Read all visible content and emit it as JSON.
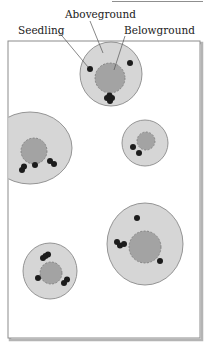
{
  "figure": {
    "width": 207,
    "height": 345,
    "colors": {
      "background": "#ffffff",
      "frame_border": "#8c8c8c",
      "frame_shadow": "#b4b4b4",
      "aboveground_fill": "#d6d6d6",
      "aboveground_stroke": "#8a8a8a",
      "belowground_fill": "#a3a3a3",
      "belowground_stroke": "#7a7a7a",
      "seedling": "#1c1c1c",
      "leader_line": "#555555",
      "top_rule": "#8f8f8f"
    },
    "top_rule": {
      "x1": 112,
      "x2": 203,
      "y": 1.5
    },
    "frame": {
      "x": 8,
      "y": 41,
      "width": 192,
      "height": 297
    },
    "labels": {
      "aboveground": {
        "text": "Aboveground",
        "x": 65,
        "y": 18
      },
      "seedling": {
        "text": "Seedling",
        "x": 18,
        "y": 34
      },
      "belowground": {
        "text": "Belowground",
        "x": 124,
        "y": 34
      }
    },
    "leaders": [
      {
        "name": "seedling-leader",
        "x1": 58,
        "y1": 31,
        "x2": 88,
        "y2": 67
      },
      {
        "name": "aboveground-leader",
        "x1": 90,
        "y1": 21,
        "x2": 103,
        "y2": 53
      },
      {
        "name": "belowground-leader",
        "x1": 125,
        "y1": 36,
        "x2": 114,
        "y2": 70
      }
    ],
    "patches": [
      {
        "name": "patch-top",
        "outer": {
          "cx": 111,
          "cy": 74,
          "rx": 31,
          "ry": 32
        },
        "inner": {
          "cx": 110,
          "cy": 78,
          "r": 15
        },
        "seedlings": [
          [
            90,
            69
          ],
          [
            130,
            63
          ],
          [
            107,
            98
          ],
          [
            112,
            98
          ],
          [
            109.5,
            95.5
          ],
          [
            110,
            101
          ]
        ]
      },
      {
        "name": "patch-left",
        "outer": {
          "cx": 30,
          "cy": 148,
          "rx": 42,
          "ry": 36
        },
        "inner": {
          "cx": 34,
          "cy": 151,
          "r": 13
        },
        "seedlings": [
          [
            22,
            170
          ],
          [
            24,
            166.5
          ],
          [
            35,
            165
          ],
          [
            50,
            161
          ],
          [
            54,
            164
          ]
        ]
      },
      {
        "name": "patch-small-right",
        "outer": {
          "cx": 145,
          "cy": 143,
          "rx": 23,
          "ry": 23
        },
        "inner": {
          "cx": 146,
          "cy": 141,
          "r": 9
        },
        "seedlings": [
          [
            133,
            147
          ],
          [
            139,
            153
          ]
        ]
      },
      {
        "name": "patch-bottom-right",
        "outer": {
          "cx": 145,
          "cy": 244,
          "rx": 38,
          "ry": 41
        },
        "inner": {
          "cx": 145,
          "cy": 247,
          "r": 16
        },
        "seedlings": [
          [
            137,
            218
          ],
          [
            117,
            242
          ],
          [
            120,
            245.5
          ],
          [
            124,
            244
          ],
          [
            160,
            261
          ]
        ]
      },
      {
        "name": "patch-bottom-left",
        "outer": {
          "cx": 50,
          "cy": 271,
          "rx": 27,
          "ry": 28
        },
        "inner": {
          "cx": 51,
          "cy": 273,
          "r": 11
        },
        "seedlings": [
          [
            43,
            258
          ],
          [
            48,
            254.5
          ],
          [
            45.5,
            256
          ],
          [
            38,
            278
          ],
          [
            64,
            283
          ],
          [
            67,
            279.5
          ]
        ]
      }
    ],
    "seedling_radius": 3
  }
}
